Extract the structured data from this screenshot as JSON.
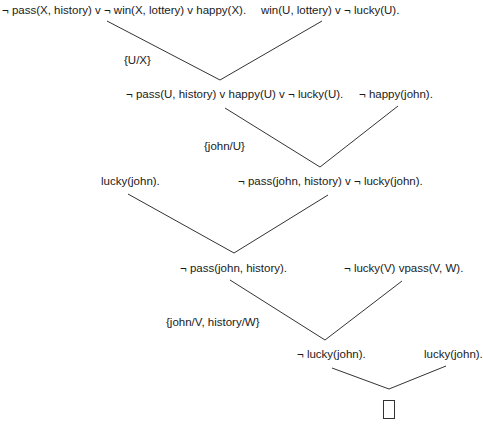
{
  "diagram": {
    "type": "resolution-refutation-tree",
    "clauses": {
      "c1": "¬ pass(X, history) v ¬ win(X, lottery) v happy(X).",
      "c2": "win(U, lottery) v ¬ lucky(U).",
      "c3": "¬ pass(U, history) v happy(U) v ¬ lucky(U).",
      "c4": "¬ happy(john).",
      "c5": "lucky(john).",
      "c6": "¬ pass(john, history) v ¬ lucky(john).",
      "c7": "¬ pass(john, history).",
      "c8": "¬ lucky(V) vpass(V, W).",
      "c9": "¬ lucky(john).",
      "c10": "lucky(john).",
      "empty": "□"
    },
    "substitutions": {
      "s1": "{U/X}",
      "s2": "{john/U}",
      "s3": "{john/V, history/W}"
    },
    "resolutions": [
      {
        "parents": [
          "c1",
          "c2"
        ],
        "result": "c3",
        "substitution": "s1"
      },
      {
        "parents": [
          "c3",
          "c4"
        ],
        "result": "c6",
        "substitution": "s2"
      },
      {
        "parents": [
          "c5",
          "c6"
        ],
        "result": "c7",
        "substitution": null
      },
      {
        "parents": [
          "c7",
          "c8"
        ],
        "result": "c9",
        "substitution": "s3"
      },
      {
        "parents": [
          "c9",
          "c10"
        ],
        "result": "empty",
        "substitution": null
      }
    ],
    "edge_color": "#333333"
  }
}
